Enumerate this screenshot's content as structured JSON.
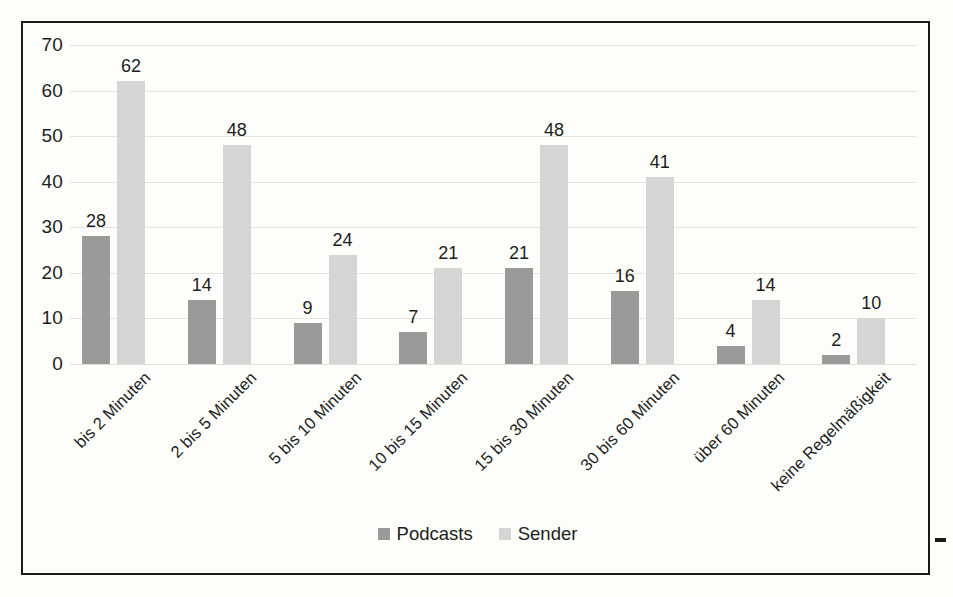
{
  "chart_data": {
    "type": "bar",
    "title": "",
    "xlabel": "",
    "ylabel": "",
    "ylim": [
      0,
      70
    ],
    "ytick_values": [
      70,
      60,
      50,
      40,
      30,
      20,
      10,
      0
    ],
    "grid": true,
    "legend_position": "bottom",
    "categories": [
      "bis 2 Minuten",
      "2 bis 5 Minuten",
      "5 bis 10 Minuten",
      "10 bis 15 Minuten",
      "15 bis 30 Minuten",
      "30 bis 60 Minuten",
      "über 60 Minuten",
      "keine Regelmäßigkeit"
    ],
    "series": [
      {
        "name": "Podcasts",
        "color": "#9a9a9a",
        "values": [
          28,
          14,
          9,
          7,
          21,
          16,
          4,
          2
        ]
      },
      {
        "name": "Sender",
        "color": "#d5d5d5",
        "values": [
          62,
          48,
          24,
          21,
          48,
          41,
          14,
          10
        ]
      }
    ]
  },
  "legend": {
    "items": [
      {
        "label": "Podcasts",
        "color": "#9a9a9a"
      },
      {
        "label": "Sender",
        "color": "#d5d5d5"
      }
    ]
  },
  "colors": {
    "series_podcasts": "#9a9a9a",
    "series_sender": "#d5d5d5",
    "gridline": "#e2e2e0",
    "frame": "#1a1a1a",
    "text": "#1d1d1b",
    "background": "#fdfdfc"
  }
}
